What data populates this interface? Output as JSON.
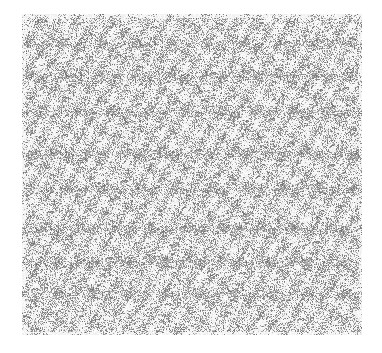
{
  "image": {
    "description": "dense grayscale glyph/noise texture",
    "background": "#ffffff",
    "region": {
      "x": 22,
      "y": 14,
      "width": 340,
      "height": 321
    },
    "ink_color": "#6e6e6e",
    "bands": [
      {
        "y": 30,
        "strength": 0.55
      },
      {
        "y": 62,
        "strength": 0.65
      },
      {
        "y": 98,
        "strength": 0.6
      },
      {
        "y": 140,
        "strength": 0.7
      },
      {
        "y": 175,
        "strength": 0.65
      },
      {
        "y": 215,
        "strength": 0.75
      },
      {
        "y": 248,
        "strength": 0.7
      },
      {
        "y": 280,
        "strength": 0.6
      }
    ]
  }
}
